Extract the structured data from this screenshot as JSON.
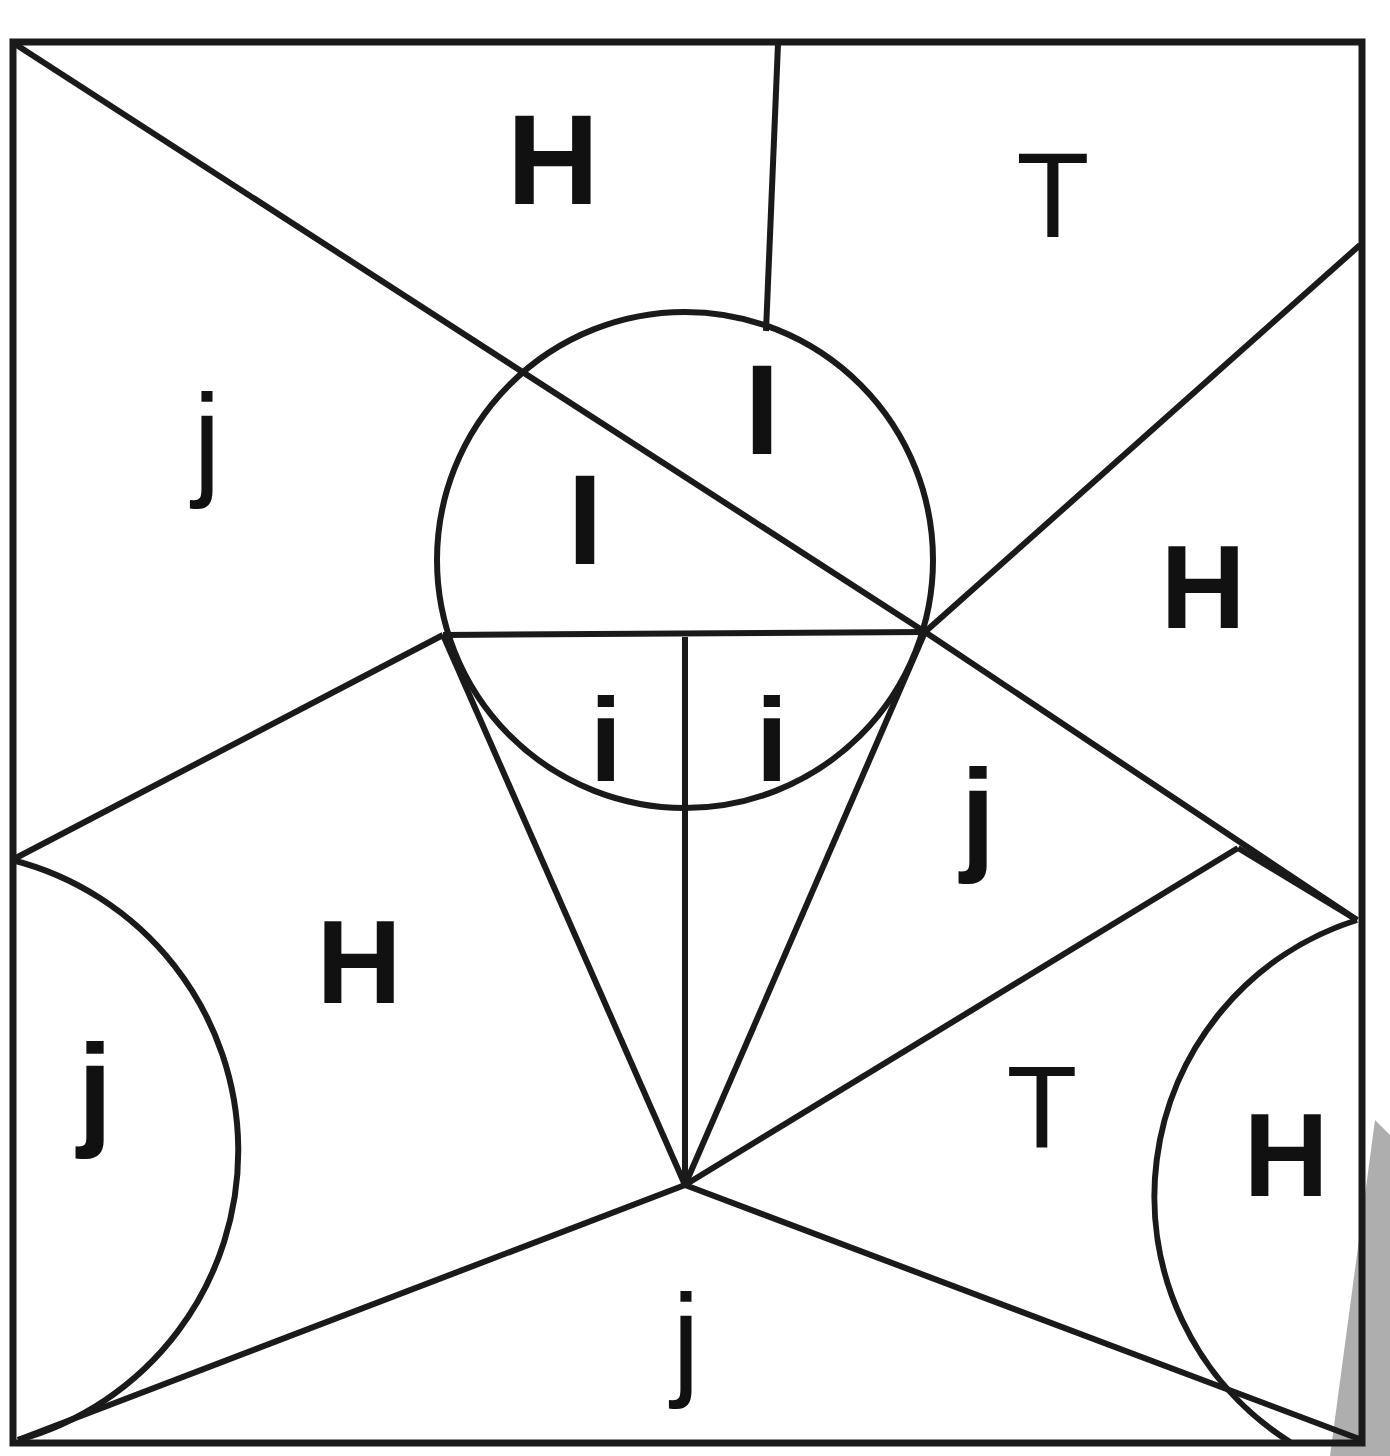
{
  "page": {
    "width": 1390,
    "height": 1456,
    "background_color": "#ffffff",
    "ink_color": "#1a1a1a",
    "shadow_color": "#a0a0a0"
  },
  "figure": {
    "frame": {
      "left": 13,
      "top": 42,
      "right": 1362,
      "bottom": 1443,
      "stroke_width": 7
    },
    "circle": {
      "center_x": 685,
      "center_y": 560,
      "radius": 248,
      "stroke_width": 6
    },
    "arcs": [
      {
        "name": "left-bulge-arc",
        "start_x": 12,
        "start_y": 860,
        "end_x": 18,
        "end_y": 1440,
        "radius": 300,
        "sweep": 1
      },
      {
        "name": "right-bulge-arc",
        "start_x": 1357,
        "start_y": 920,
        "end_x": 1290,
        "end_y": 1442,
        "radius": 290,
        "sweep": 0
      }
    ],
    "segments": [
      {
        "name": "top-left-diagonal",
        "x1": 15,
        "y1": 44,
        "x2": 925,
        "y2": 632
      },
      {
        "name": "top-vertical-stub",
        "x1": 778,
        "y1": 44,
        "x2": 766,
        "y2": 331
      },
      {
        "name": "right-upper-diagonal",
        "x1": 925,
        "y1": 632,
        "x2": 1360,
        "y2": 245
      },
      {
        "name": "right-lower-diagonal",
        "x1": 925,
        "y1": 632,
        "x2": 1357,
        "y2": 920
      },
      {
        "name": "chord-horizontal",
        "x1": 443,
        "y1": 635,
        "x2": 925,
        "y2": 632
      },
      {
        "name": "left-fan-upper",
        "x1": 443,
        "y1": 635,
        "x2": 12,
        "y2": 860
      },
      {
        "name": "fan-left-spoke",
        "x1": 443,
        "y1": 635,
        "x2": 685,
        "y2": 1185
      },
      {
        "name": "fan-middle-spoke",
        "x1": 685,
        "y1": 637,
        "x2": 685,
        "y2": 1185
      },
      {
        "name": "fan-right-spoke",
        "x1": 925,
        "y1": 632,
        "x2": 685,
        "y2": 1185
      },
      {
        "name": "lower-right-to-edge",
        "x1": 685,
        "y1": 1185,
        "x2": 1238,
        "y2": 848
      },
      {
        "name": "edge-kink-to-corner",
        "x1": 1238,
        "y1": 848,
        "x2": 1357,
        "y2": 920
      },
      {
        "name": "bottom-right-long",
        "x1": 685,
        "y1": 1185,
        "x2": 1362,
        "y2": 1440
      },
      {
        "name": "bottom-left-long",
        "x1": 685,
        "y1": 1185,
        "x2": 18,
        "y2": 1440
      }
    ],
    "shadow_wedge": {
      "name": "page-edge-shadow",
      "points": "1375,1120 1390,1135 1390,1456 1330,1456"
    }
  },
  "labels": [
    {
      "name": "label-H-top",
      "text": "H",
      "x": 553,
      "y": 170,
      "size": 128,
      "weight": "bold"
    },
    {
      "name": "label-T-topright",
      "text": "T",
      "x": 1053,
      "y": 205,
      "size": 120,
      "weight": "light"
    },
    {
      "name": "label-j-left",
      "text": "j",
      "x": 207,
      "y": 450,
      "size": 126,
      "weight": "light"
    },
    {
      "name": "label-I-circle-right",
      "text": "I",
      "x": 762,
      "y": 420,
      "size": 128,
      "weight": "bold"
    },
    {
      "name": "label-I-circle-left",
      "text": "I",
      "x": 585,
      "y": 530,
      "size": 128,
      "weight": "bold"
    },
    {
      "name": "label-H-right",
      "text": "H",
      "x": 1203,
      "y": 597,
      "size": 118,
      "weight": "bold"
    },
    {
      "name": "label-i-wedge-left",
      "text": "i",
      "x": 606,
      "y": 750,
      "size": 118,
      "weight": "bold"
    },
    {
      "name": "label-i-wedge-right",
      "text": "i",
      "x": 772,
      "y": 750,
      "size": 118,
      "weight": "bold"
    },
    {
      "name": "label-j-midright",
      "text": "j",
      "x": 978,
      "y": 825,
      "size": 126,
      "weight": "bold"
    },
    {
      "name": "label-H-lowerleft",
      "text": "H",
      "x": 359,
      "y": 972,
      "size": 118,
      "weight": "bold"
    },
    {
      "name": "label-j-lowerleft",
      "text": "j",
      "x": 95,
      "y": 1100,
      "size": 126,
      "weight": "bold"
    },
    {
      "name": "label-T-lowerright",
      "text": "T",
      "x": 1042,
      "y": 1117,
      "size": 116,
      "weight": "light"
    },
    {
      "name": "label-H-rightbulge",
      "text": "H",
      "x": 1286,
      "y": 1165,
      "size": 118,
      "weight": "bold"
    },
    {
      "name": "label-j-bottom",
      "text": "j",
      "x": 686,
      "y": 1350,
      "size": 126,
      "weight": "light"
    }
  ]
}
